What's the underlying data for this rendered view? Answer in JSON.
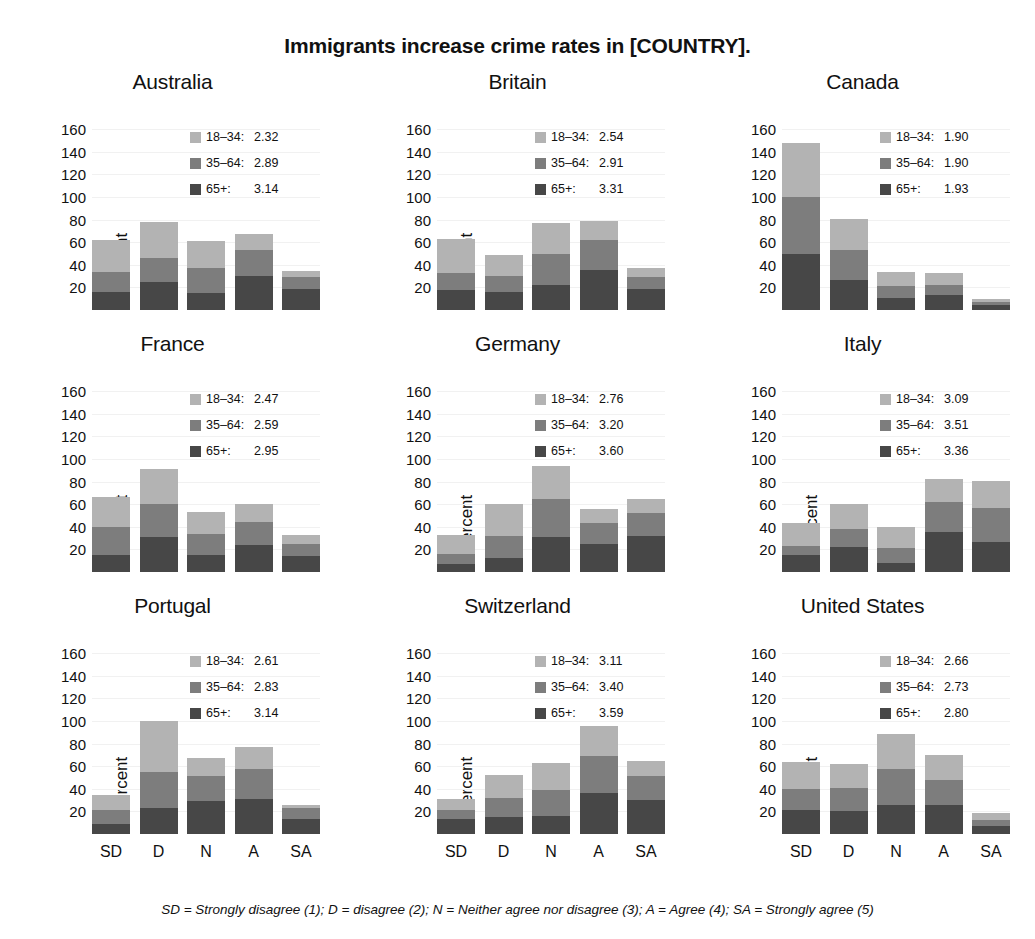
{
  "title": "Immigrants increase crime rates in [COUNTRY].",
  "ylabel": "Percent",
  "footnote": "SD = Strongly disagree (1); D = disagree (2); N = Neither agree nor disagree (3); A = Agree (4); SA = Strongly agree (5)",
  "colors": {
    "18-34": "#b3b3b3",
    "35-64": "#7d7d7d",
    "65+": "#474747",
    "gridline": "#f1f1f1",
    "text": "#111111",
    "background": "#ffffff"
  },
  "yticks": [
    160,
    140,
    120,
    100,
    80,
    60,
    40,
    20
  ],
  "ylim": [
    0,
    170
  ],
  "categories": [
    "SD",
    "D",
    "N",
    "A",
    "SA"
  ],
  "series_names": [
    "18-34",
    "35-64",
    "65+"
  ],
  "legend_labels": {
    "young": "18–34:",
    "middle": "35–64:",
    "old": "65+:"
  },
  "chart_data": {
    "type": "bar",
    "subtype": "stacked-bar-small-multiples",
    "title": "Immigrants increase crime rates in [COUNTRY].",
    "xlabel": "",
    "ylabel": "Percent",
    "ylim": [
      0,
      170
    ],
    "yticks": [
      20,
      40,
      60,
      80,
      100,
      120,
      140,
      160
    ],
    "grid": true,
    "legend_position": "top-right (inside each panel)",
    "categories": [
      "SD",
      "D",
      "N",
      "A",
      "SA"
    ],
    "stack_order_bottom_to_top": [
      "65+",
      "35-64",
      "18-34"
    ],
    "note": "SD = Strongly disagree (1); D = disagree (2); N = Neither agree nor disagree (3); A = Agree (4); SA = Strongly agree (5)",
    "panels": [
      {
        "name": "Australia",
        "means": {
          "18-34": 2.32,
          "35-64": 2.89,
          "65+": 3.14
        },
        "series": [
          {
            "name": "65+",
            "values": [
              16,
              25,
              15,
              30,
              19
            ]
          },
          {
            "name": "35-64",
            "values": [
              18,
              21,
              22,
              23,
              10
            ]
          },
          {
            "name": "18-34",
            "values": [
              28,
              32,
              24,
              14,
              6
            ]
          }
        ],
        "totals": [
          62,
          78,
          61,
          67,
          35
        ]
      },
      {
        "name": "Britain",
        "means": {
          "18-34": 2.54,
          "35-64": 2.91,
          "65+": 3.31
        },
        "series": [
          {
            "name": "65+",
            "values": [
              18,
              16,
              22,
              35,
              19
            ]
          },
          {
            "name": "35-64",
            "values": [
              15,
              14,
              28,
              27,
              10
            ]
          },
          {
            "name": "18-34",
            "values": [
              30,
              19,
              27,
              17,
              8
            ]
          }
        ],
        "totals": [
          63,
          49,
          77,
          79,
          37
        ]
      },
      {
        "name": "Canada",
        "means": {
          "18-34": 1.9,
          "35-64": 1.9,
          "65+": 1.93
        },
        "series": [
          {
            "name": "65+",
            "values": [
              50,
              27,
              11,
              13,
              4
            ]
          },
          {
            "name": "35-64",
            "values": [
              50,
              26,
              10,
              9,
              3
            ]
          },
          {
            "name": "18-34",
            "values": [
              48,
              28,
              13,
              11,
              3
            ]
          }
        ],
        "totals": [
          148,
          81,
          34,
          33,
          10
        ]
      },
      {
        "name": "France",
        "means": {
          "18-34": 2.47,
          "35-64": 2.59,
          "65+": 2.95
        },
        "series": [
          {
            "name": "65+",
            "values": [
              15,
              31,
              15,
              24,
              14
            ]
          },
          {
            "name": "35-64",
            "values": [
              25,
              29,
              19,
              20,
              11
            ]
          },
          {
            "name": "18-34",
            "values": [
              26,
              31,
              19,
              16,
              8
            ]
          }
        ],
        "totals": [
          66,
          91,
          53,
          60,
          33
        ]
      },
      {
        "name": "Germany",
        "means": {
          "18-34": 2.76,
          "35-64": 3.2,
          "65+": 3.6
        },
        "series": [
          {
            "name": "65+",
            "values": [
              7,
              12,
              31,
              25,
              32
            ]
          },
          {
            "name": "35-64",
            "values": [
              9,
              20,
              34,
              18,
              20
            ]
          },
          {
            "name": "18-34",
            "values": [
              17,
              28,
              29,
              13,
              13
            ]
          }
        ],
        "totals": [
          33,
          60,
          94,
          56,
          65
        ]
      },
      {
        "name": "Italy",
        "means": {
          "18-34": 3.09,
          "35-64": 3.51,
          "65+": 3.36
        },
        "series": [
          {
            "name": "65+",
            "values": [
              15,
              22,
              8,
              35,
              27
            ]
          },
          {
            "name": "35-64",
            "values": [
              8,
              16,
              13,
              27,
              30
            ]
          },
          {
            "name": "18-34",
            "values": [
              20,
              22,
              19,
              20,
              24
            ]
          }
        ],
        "totals": [
          43,
          60,
          40,
          82,
          81
        ]
      },
      {
        "name": "Portugal",
        "means": {
          "18-34": 2.61,
          "35-64": 2.83,
          "65+": 3.14
        },
        "series": [
          {
            "name": "65+",
            "values": [
              9,
              23,
              29,
              31,
              13
            ]
          },
          {
            "name": "35-64",
            "values": [
              12,
              32,
              22,
              27,
              10
            ]
          },
          {
            "name": "18-34",
            "values": [
              14,
              45,
              16,
              19,
              3
            ]
          }
        ],
        "totals": [
          35,
          100,
          67,
          77,
          26
        ]
      },
      {
        "name": "Switzerland",
        "means": {
          "18-34": 3.11,
          "35-64": 3.4,
          "65+": 3.59
        },
        "series": [
          {
            "name": "65+",
            "values": [
              13,
              15,
              16,
              36,
              30
            ]
          },
          {
            "name": "35-64",
            "values": [
              8,
              17,
              23,
              33,
              21
            ]
          },
          {
            "name": "18-34",
            "values": [
              10,
              20,
              24,
              27,
              14
            ]
          }
        ],
        "totals": [
          31,
          52,
          63,
          96,
          65
        ]
      },
      {
        "name": "United States",
        "means": {
          "18-34": 2.66,
          "35-64": 2.73,
          "65+": 2.8
        },
        "series": [
          {
            "name": "65+",
            "values": [
              21,
              20,
              26,
              26,
              7
            ]
          },
          {
            "name": "35-64",
            "values": [
              19,
              21,
              32,
              22,
              5
            ]
          },
          {
            "name": "18-34",
            "values": [
              24,
              21,
              31,
              22,
              7
            ]
          }
        ],
        "totals": [
          64,
          62,
          89,
          70,
          19
        ]
      }
    ]
  }
}
